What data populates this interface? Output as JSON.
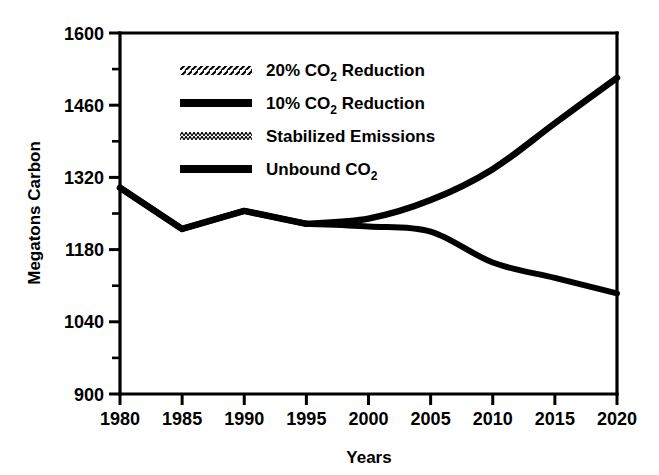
{
  "chart_data": {
    "type": "line",
    "title": "",
    "xlabel": "Years",
    "ylabel": "Megatons Carbon",
    "xlim": [
      1980,
      2020
    ],
    "ylim": [
      900,
      1600
    ],
    "grid": false,
    "legend_position": "upper-left-inside",
    "x_ticks": [
      1980,
      1985,
      1990,
      1995,
      2000,
      2005,
      2010,
      2015,
      2020
    ],
    "x_tick_labels": [
      "1980",
      "1985",
      "1990",
      "1995",
      "2000",
      "2005",
      "2010",
      "2015",
      "2020"
    ],
    "y_ticks": [
      900,
      1040,
      1180,
      1320,
      1460,
      1600
    ],
    "y_tick_labels": [
      "900",
      "1040",
      "1180",
      "1320",
      "1460",
      "1600"
    ],
    "y_minor_ticks": [
      970,
      1110,
      1250,
      1390,
      1530
    ],
    "x": [
      1980,
      1985,
      1990,
      1995,
      2000,
      2005,
      2010,
      2015,
      2020
    ],
    "series": [
      {
        "name": "20% CO2 Reduction",
        "label_main": "20% CO",
        "label_sub": "2",
        "label_tail": " Reduction",
        "style": "hatched",
        "values": [
          1300,
          1220,
          1255,
          1230,
          1222,
          1140,
          1045,
          965,
          905
        ]
      },
      {
        "name": "10% CO2 Reduction",
        "label_main": "10% CO",
        "label_sub": "2",
        "label_tail": " Reduction",
        "style": "thick-solid",
        "values": [
          1300,
          1220,
          1255,
          1230,
          1225,
          1215,
          1155,
          1125,
          1095
        ]
      },
      {
        "name": "Stabilized Emissions",
        "label_main": "Stabilized Emissions",
        "label_sub": "",
        "label_tail": "",
        "style": "fine-dotted",
        "values": [
          1300,
          1220,
          1255,
          1230,
          1238,
          1262,
          1282,
          1287,
          1287
        ]
      },
      {
        "name": "Unbound CO2",
        "label_main": "Unbound CO",
        "label_sub": "2",
        "label_tail": "",
        "style": "thick-solid",
        "values": [
          1300,
          1220,
          1255,
          1230,
          1240,
          1276,
          1336,
          1425,
          1513
        ]
      }
    ],
    "colors": {
      "line": "#000000",
      "axis": "#000000",
      "background": "#ffffff"
    }
  },
  "legend": {
    "entries": [
      {
        "label_main": "20% CO",
        "label_sub": "2",
        "label_tail": " Reduction",
        "swatch": "hatched-swatch"
      },
      {
        "label_main": "10% CO",
        "label_sub": "2",
        "label_tail": " Reduction",
        "swatch": "thick-solid-swatch"
      },
      {
        "label_main": "Stabilized Emissions",
        "label_sub": "",
        "label_tail": "",
        "swatch": "fine-dotted-swatch"
      },
      {
        "label_main": "Unbound CO",
        "label_sub": "2",
        "label_tail": "",
        "swatch": "thick-solid-swatch"
      }
    ]
  },
  "axes": {
    "x_title": "Years",
    "y_title": "Megatons Carbon",
    "x_tick_labels": [
      "1980",
      "1985",
      "1990",
      "1995",
      "2000",
      "2005",
      "2010",
      "2015",
      "2020"
    ],
    "y_tick_labels": [
      "900",
      "1040",
      "1180",
      "1320",
      "1460",
      "1600"
    ]
  }
}
